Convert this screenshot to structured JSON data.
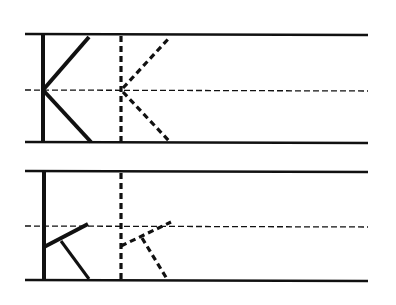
{
  "worksheet": {
    "title": "Letter K handwriting practice",
    "ink_color": "#111111",
    "background": "#ffffff",
    "rows": [
      {
        "name": "uppercase-row",
        "letter": "K",
        "case": "uppercase",
        "model": "solid",
        "trace": "dashed"
      },
      {
        "name": "lowercase-row",
        "letter": "k",
        "case": "lowercase",
        "model": "solid",
        "trace": "dashed"
      }
    ]
  }
}
